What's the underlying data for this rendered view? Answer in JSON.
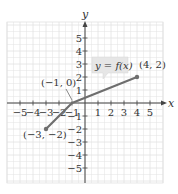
{
  "chart_data": {
    "type": "line",
    "title": "",
    "xlabel": "x",
    "ylabel": "y",
    "xlim": [
      -6,
      6
    ],
    "ylim": [
      -6,
      6
    ],
    "grid": true,
    "xticks": [
      -5,
      -4,
      -3,
      -2,
      -1,
      1,
      2,
      3,
      4,
      5
    ],
    "yticks": [
      -5,
      -4,
      -3,
      -2,
      -1,
      1,
      2,
      3,
      4,
      5
    ],
    "xtick_labels": [
      "−5",
      "−4",
      "−3",
      "−2",
      "−1",
      "1",
      "2",
      "3",
      "4",
      "5"
    ],
    "ytick_labels": [
      "−5",
      "−4",
      "−3",
      "−2",
      "−1",
      "1",
      "2",
      "3",
      "4",
      "5"
    ],
    "series": [
      {
        "name": "y = f(x)",
        "points": [
          [
            -3,
            -2
          ],
          [
            -1,
            0
          ],
          [
            4,
            2
          ]
        ],
        "color": "#6e6e6e",
        "endpoints_marked": true
      }
    ],
    "annotations": [
      {
        "text": "(−1, 0)",
        "x": -1,
        "y": 0
      },
      {
        "text": "(4, 2)",
        "x": 4,
        "y": 2
      },
      {
        "text": "(−3, −2)",
        "x": -3,
        "y": -2
      },
      {
        "text": "y = f(x)",
        "type": "callout"
      }
    ]
  },
  "labels": {
    "x_axis": "x",
    "y_axis": "y",
    "function": "y = f(x)",
    "point_a": "(−3, −2)",
    "point_b": "(−1, 0)",
    "point_c": "(4, 2)"
  },
  "colors": {
    "grid": "#e2e2e2",
    "axis": "#444444",
    "curve": "#6e6e6e",
    "callout_bg": "#e6e6e6"
  }
}
